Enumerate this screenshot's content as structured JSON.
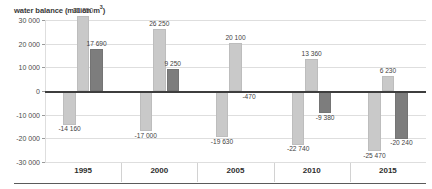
{
  "chart_data": {
    "type": "bar",
    "title": "water balance (million m",
    "title_sup": "3",
    "title_suffix": ")",
    "title_full": "water balance (million m³)",
    "xlabel": "",
    "ylabel": "water balance (million m³)",
    "ylim": [
      -30000,
      30000
    ],
    "ytick_labels": [
      "30 000",
      "20 000",
      "10 000",
      "0",
      "-10 000",
      "-20 000",
      "-30 000"
    ],
    "ytick_values": [
      30000,
      20000,
      10000,
      0,
      -10000,
      -20000,
      -30000
    ],
    "grid": true,
    "legend": false,
    "legend_position": "none",
    "categories": [
      "1995",
      "2000",
      "2005",
      "2010",
      "2015"
    ],
    "series": [
      {
        "name": "series-1-light-negative",
        "color": "#c9c9c9",
        "values": [
          -14160,
          -17000,
          -19630,
          -22740,
          -25470
        ],
        "labels": [
          "-14 160",
          "-17 000",
          "-19 630",
          "-22 740",
          "-25 470"
        ]
      },
      {
        "name": "series-2-light-positive",
        "color": "#c9c9c9",
        "values": [
          31850,
          26250,
          20100,
          13360,
          6230
        ],
        "labels": [
          "31 850",
          "26 250",
          "20 100",
          "13 360",
          "6 230"
        ]
      },
      {
        "name": "series-3-dark",
        "color": "#7d7d7d",
        "values": [
          17690,
          9250,
          -470,
          -9380,
          -20240
        ],
        "labels": [
          "17 690",
          "9 250",
          "-470",
          "-9 380",
          "-20 240"
        ]
      }
    ],
    "colors": {
      "light_bar": "#c9c9c9",
      "dark_bar": "#7d7d7d",
      "gridline": "#dedede",
      "zero_line": "#3d3d3d",
      "text": "#3f3f3f",
      "background": "#ffffff"
    }
  }
}
